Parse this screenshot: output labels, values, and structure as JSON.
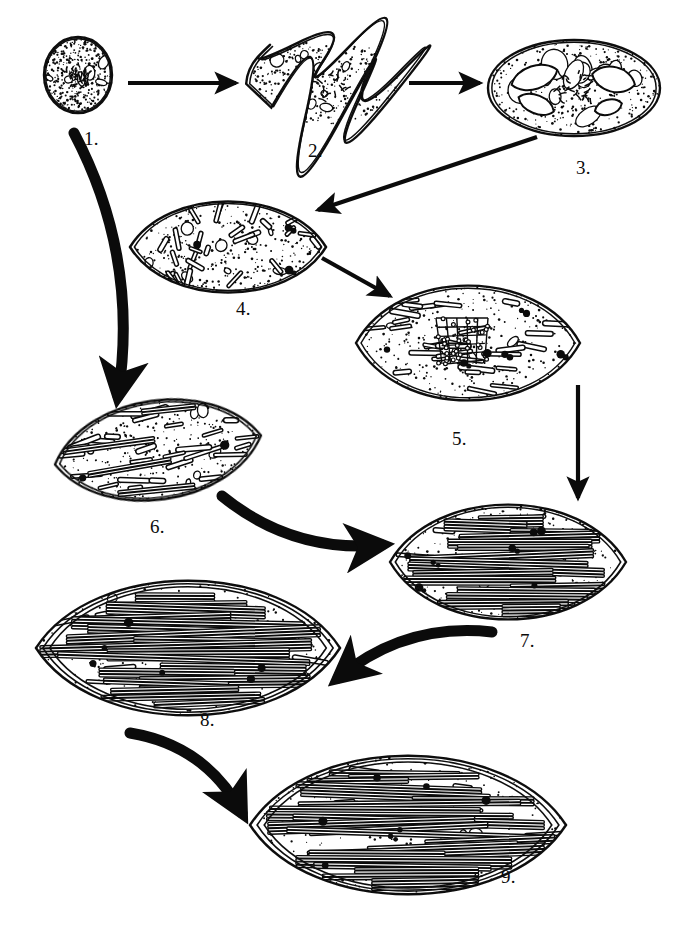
{
  "figure": {
    "kind": "biological-process-diagram",
    "background_color": "#ffffff",
    "ink_color": "#0b0b0b",
    "width": 686,
    "height": 934,
    "stage_count": 9
  },
  "stages": [
    {
      "id": "stage-1",
      "label": "1.",
      "label_x": 84,
      "label_y": 128,
      "shape": "circle",
      "cx": 78,
      "cy": 75,
      "rx": 34,
      "ry": 38,
      "rotation": 0,
      "envelope_layers": 2,
      "stipple_density": "high",
      "contents": "dense stipple with small irregular vesicles",
      "vesicles": 6,
      "rods": 0,
      "lamellae": 0,
      "granules": 0
    },
    {
      "id": "stage-2",
      "label": "2.",
      "label_x": 308,
      "label_y": 140,
      "shape": "amoeboid",
      "cx": 325,
      "cy": 82,
      "rx": 78,
      "ry": 42,
      "rotation": 0,
      "envelope_layers": 2,
      "stipple_density": "high",
      "contents": "lobed amoeboid body with central nucleoid cluster",
      "vesicles": 10,
      "rods": 0,
      "lamellae": 0,
      "granules": 0
    },
    {
      "id": "stage-3",
      "label": "3.",
      "label_x": 576,
      "label_y": 157,
      "shape": "broad-ellipse",
      "cx": 574,
      "cy": 88,
      "rx": 86,
      "ry": 48,
      "rotation": 0,
      "envelope_layers": 2,
      "stipple_density": "high",
      "contents": "ellipse with clear lens-shaped vacuoles and central nucleoid",
      "vesicles": 14,
      "rods": 0,
      "lamellae": 0,
      "granules": 0
    },
    {
      "id": "stage-4",
      "label": "4.",
      "label_x": 236,
      "label_y": 298,
      "shape": "lens",
      "cx": 228,
      "cy": 247,
      "rx": 98,
      "ry": 46,
      "rotation": 0,
      "envelope_layers": 2,
      "stipple_density": "medium",
      "contents": "scattered short rods (prolamellar fragments) and dark granules",
      "vesicles": 8,
      "rods": 26,
      "lamellae": 0,
      "granules": 3
    },
    {
      "id": "stage-5",
      "label": "5.",
      "label_x": 452,
      "label_y": 428,
      "shape": "lens",
      "cx": 468,
      "cy": 343,
      "rx": 112,
      "ry": 58,
      "rotation": 0,
      "envelope_layers": 2,
      "stipple_density": "medium",
      "contents": "horizontal rods with central beaded prolamellar body lattice",
      "vesicles": 4,
      "rods": 30,
      "lamellae": 0,
      "granules": 6
    },
    {
      "id": "stage-6",
      "label": "6.",
      "label_x": 150,
      "label_y": 516,
      "shape": "lens",
      "cx": 158,
      "cy": 450,
      "rx": 104,
      "ry": 50,
      "rotation": -8,
      "envelope_layers": 2,
      "stipple_density": "medium",
      "contents": "elongating rods beginning to stack into short lamellar groups",
      "vesicles": 6,
      "rods": 28,
      "lamellae": 4,
      "granules": 2
    },
    {
      "id": "stage-7",
      "label": "7.",
      "label_x": 520,
      "label_y": 630,
      "shape": "lens",
      "cx": 508,
      "cy": 562,
      "rx": 118,
      "ry": 58,
      "rotation": 0,
      "envelope_layers": 2,
      "stipple_density": "medium",
      "contents": "dense stacked grana lamellae throughout stroma",
      "vesicles": 6,
      "rods": 12,
      "lamellae": 16,
      "granules": 7
    },
    {
      "id": "stage-8",
      "label": "8.",
      "label_x": 200,
      "label_y": 709,
      "shape": "lens",
      "cx": 188,
      "cy": 648,
      "rx": 152,
      "ry": 68,
      "rotation": 0,
      "envelope_layers": 3,
      "stipple_density": "medium",
      "contents": "long parallel lamellae spanning the plastid with peripheral stacks",
      "vesicles": 5,
      "rods": 8,
      "lamellae": 18,
      "granules": 6
    },
    {
      "id": "stage-9",
      "label": "9.",
      "label_x": 501,
      "label_y": 866,
      "shape": "lens",
      "cx": 408,
      "cy": 825,
      "rx": 158,
      "ry": 70,
      "rotation": 0,
      "envelope_layers": 3,
      "stipple_density": "medium",
      "contents": "mature plastid with fully developed continuous lamellar system",
      "vesicles": 4,
      "rods": 6,
      "lamellae": 22,
      "granules": 7
    }
  ],
  "arrows": [
    {
      "id": "arrow-1-to-2",
      "from": "stage-1",
      "to": "stage-2",
      "style": "straight",
      "weight": "thin",
      "x1": 128,
      "y1": 83,
      "x2": 236,
      "y2": 83,
      "curve": 0
    },
    {
      "id": "arrow-2-to-3",
      "from": "stage-2",
      "to": "stage-3",
      "style": "straight",
      "weight": "thin",
      "x1": 409,
      "y1": 83,
      "x2": 480,
      "y2": 83,
      "curve": 0
    },
    {
      "id": "arrow-3-to-4",
      "from": "stage-3",
      "to": "stage-4",
      "style": "straight",
      "weight": "thin",
      "x1": 537,
      "y1": 137,
      "x2": 318,
      "y2": 210,
      "curve": 0
    },
    {
      "id": "arrow-4-to-5",
      "from": "stage-4",
      "to": "stage-5",
      "style": "straight",
      "weight": "thin",
      "x1": 322,
      "y1": 258,
      "x2": 390,
      "y2": 296,
      "curve": 0
    },
    {
      "id": "arrow-5-to-7",
      "from": "stage-5",
      "to": "stage-7",
      "style": "straight",
      "weight": "thin",
      "x1": 578,
      "y1": 385,
      "x2": 578,
      "y2": 498,
      "curve": 0
    },
    {
      "id": "arrow-1-to-6",
      "from": "stage-1",
      "to": "stage-6",
      "style": "curved",
      "weight": "thick",
      "x1": 74,
      "y1": 133,
      "x2": 118,
      "y2": 396,
      "curve": -44
    },
    {
      "id": "arrow-6-to-7",
      "from": "stage-6",
      "to": "stage-7",
      "style": "curved",
      "weight": "thick",
      "x1": 222,
      "y1": 496,
      "x2": 382,
      "y2": 545,
      "curve": 34
    },
    {
      "id": "arrow-7-to-8",
      "from": "stage-7",
      "to": "stage-8",
      "style": "curved",
      "weight": "thick",
      "x1": 492,
      "y1": 632,
      "x2": 338,
      "y2": 678,
      "curve": 34
    },
    {
      "id": "arrow-8-to-9",
      "from": "stage-8",
      "to": "stage-9",
      "style": "curved",
      "weight": "thick",
      "x1": 130,
      "y1": 733,
      "x2": 242,
      "y2": 813,
      "curve": -34
    }
  ]
}
